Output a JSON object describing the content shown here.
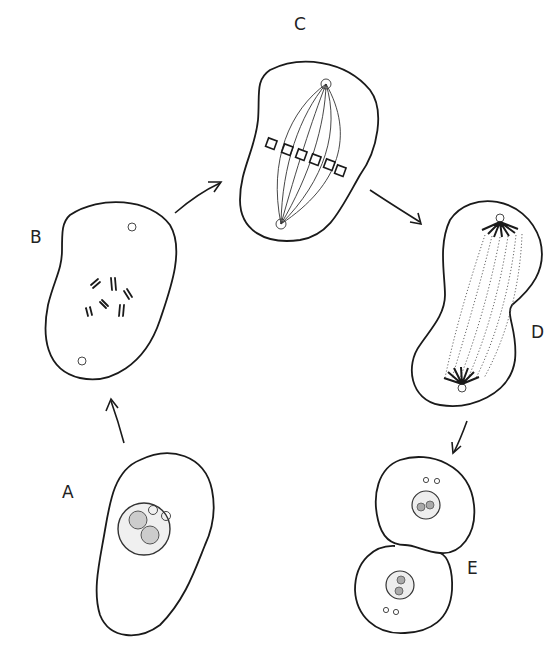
{
  "diagram": {
    "type": "cell-division-cycle",
    "stages": [
      {
        "id": "A",
        "label": "A",
        "position": {
          "x": 62,
          "y": 490
        }
      },
      {
        "id": "B",
        "label": "B",
        "position": {
          "x": 30,
          "y": 235
        }
      },
      {
        "id": "C",
        "label": "C",
        "position": {
          "x": 294,
          "y": 22
        }
      },
      {
        "id": "D",
        "label": "D",
        "position": {
          "x": 531,
          "y": 330
        }
      },
      {
        "id": "E",
        "label": "E",
        "position": {
          "x": 467,
          "y": 566
        }
      }
    ],
    "arrows": [
      {
        "from": "A",
        "to": "B"
      },
      {
        "from": "B",
        "to": "C"
      },
      {
        "from": "C",
        "to": "D"
      },
      {
        "from": "D",
        "to": "E"
      }
    ],
    "colors": {
      "line": "#1a1a1a",
      "background": "#ffffff"
    }
  }
}
